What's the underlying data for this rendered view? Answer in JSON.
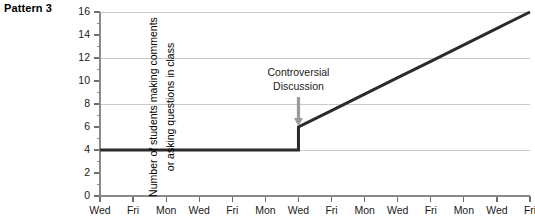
{
  "title": "Pattern 3",
  "ylabel_lines": [
    "Number of students making comments",
    "or asking questions in class"
  ],
  "annotation": {
    "line1": "Controversial",
    "line2": "Discussion"
  },
  "colors": {
    "line": "#2b2b2b",
    "grid": "#c9c9c9",
    "axis": "#8a8a8a",
    "arrow": "#9a9a9a",
    "text": "#1a1a1a"
  },
  "chart_data": {
    "type": "line",
    "title": "Pattern 3",
    "xlabel": "",
    "ylabel": "Number of students making comments or asking questions in class",
    "categories": [
      "Wed",
      "Fri",
      "Mon",
      "Wed",
      "Fri",
      "Mon",
      "Wed",
      "Fri",
      "Mon",
      "Wed",
      "Fri",
      "Mon",
      "Wed",
      "Fri"
    ],
    "values": [
      4,
      4,
      4,
      4,
      4,
      4,
      6,
      7.43,
      8.86,
      10.29,
      11.71,
      13.14,
      14.57,
      16
    ],
    "step_at_index": 6,
    "step_from": 4,
    "step_to": 6,
    "ylim": [
      0,
      16
    ],
    "ytick_values": [
      0,
      2,
      4,
      6,
      8,
      10,
      12,
      14,
      16
    ],
    "ytick_labels": [
      "0",
      "2",
      "4",
      "6",
      "8",
      "10",
      "12",
      "14",
      "16"
    ],
    "yminor_values": [
      1,
      3,
      5,
      7,
      9,
      11,
      13,
      15
    ],
    "gridline_values": [
      4,
      8,
      12,
      16
    ],
    "grid": true,
    "legend": false,
    "annotations": [
      {
        "text": "Controversial Discussion",
        "at_category": "Wed",
        "at_index": 6,
        "at_value": 6
      }
    ]
  }
}
